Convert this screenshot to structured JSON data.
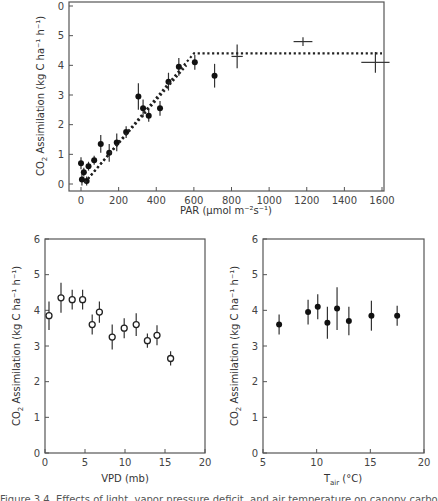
{
  "chart_data": [
    {
      "type": "scatter",
      "id": "par",
      "title": "",
      "xlabel": "PAR (µmol m⁻²s⁻¹)",
      "ylabel": "CO₂ Assimilation (kg C ha⁻¹ h⁻¹)",
      "xlim": [
        0,
        1600
      ],
      "ylim": [
        0,
        6
      ],
      "xticks": [
        0,
        200,
        400,
        600,
        800,
        1000,
        1200,
        1400,
        1600
      ],
      "yticks": [
        0,
        1,
        2,
        3,
        4,
        5,
        6
      ],
      "ytick_labels": [
        "0",
        "1",
        "2",
        "3",
        "4",
        "5",
        "0"
      ],
      "grid": false,
      "series": [
        {
          "name": "observations (filled)",
          "marker": "filled-circle",
          "points": [
            {
              "x": 0,
              "y": 0.7,
              "err": 0.2
            },
            {
              "x": 5,
              "y": 0.15,
              "err": 0.2
            },
            {
              "x": 15,
              "y": 0.4,
              "err": 0.15
            },
            {
              "x": 30,
              "y": 0.1,
              "err": 0.15
            },
            {
              "x": 40,
              "y": 0.6,
              "err": 0.15
            },
            {
              "x": 70,
              "y": 0.8,
              "err": 0.15
            },
            {
              "x": 105,
              "y": 1.35,
              "err": 0.3
            },
            {
              "x": 150,
              "y": 1.05,
              "err": 0.3
            },
            {
              "x": 190,
              "y": 1.4,
              "err": 0.3
            },
            {
              "x": 240,
              "y": 1.75,
              "err": 0.2
            },
            {
              "x": 305,
              "y": 2.95,
              "err": 0.45
            },
            {
              "x": 330,
              "y": 2.55,
              "err": 0.3
            },
            {
              "x": 360,
              "y": 2.3,
              "err": 0.2
            },
            {
              "x": 420,
              "y": 2.55,
              "err": 0.25
            },
            {
              "x": 465,
              "y": 3.45,
              "err": 0.3
            },
            {
              "x": 520,
              "y": 3.95,
              "err": 0.3
            },
            {
              "x": 605,
              "y": 4.1,
              "err": 0.25
            },
            {
              "x": 710,
              "y": 3.65,
              "err": 0.4
            }
          ]
        },
        {
          "name": "observations (cross)",
          "marker": "cross",
          "points": [
            {
              "x": 830,
              "y": 4.3,
              "err": 0.4,
              "xerr": 30
            },
            {
              "x": 1180,
              "y": 4.8,
              "err": 0.15,
              "xerr": 50
            },
            {
              "x": 1565,
              "y": 4.1,
              "err": 0.35,
              "xerr": 75
            }
          ]
        },
        {
          "name": "fitted model",
          "style": "dotted-line",
          "points": [
            {
              "x": 20,
              "y": 0.05
            },
            {
              "x": 600,
              "y": 4.4
            },
            {
              "x": 1600,
              "y": 4.4
            }
          ]
        },
        {
          "name": "fitted model (lower segment)",
          "style": "dotted-line",
          "points": [
            {
              "x": 20,
              "y": 0.05
            },
            {
              "x": 560,
              "y": 4.0
            }
          ]
        }
      ]
    },
    {
      "type": "scatter",
      "id": "vpd",
      "xlabel": "VPD (mb)",
      "ylabel": "CO₂ Assimilation (kg C ha⁻¹ h⁻¹)",
      "xlim": [
        0,
        20
      ],
      "ylim": [
        0,
        6
      ],
      "xticks": [
        0,
        5,
        10,
        15,
        20
      ],
      "yticks": [
        0,
        1,
        2,
        3,
        4,
        5,
        6
      ],
      "grid": false,
      "series": [
        {
          "name": "observations",
          "marker": "open-circle",
          "points": [
            {
              "x": 0.5,
              "y": 3.85,
              "err": 0.4
            },
            {
              "x": 2.0,
              "y": 4.35,
              "err": 0.42
            },
            {
              "x": 3.4,
              "y": 4.3,
              "err": 0.28
            },
            {
              "x": 4.7,
              "y": 4.3,
              "err": 0.28
            },
            {
              "x": 5.9,
              "y": 3.6,
              "err": 0.28
            },
            {
              "x": 6.8,
              "y": 3.95,
              "err": 0.3
            },
            {
              "x": 8.4,
              "y": 3.25,
              "err": 0.35
            },
            {
              "x": 9.9,
              "y": 3.5,
              "err": 0.28
            },
            {
              "x": 11.4,
              "y": 3.6,
              "err": 0.32
            },
            {
              "x": 12.8,
              "y": 3.15,
              "err": 0.2
            },
            {
              "x": 14.0,
              "y": 3.3,
              "err": 0.28
            },
            {
              "x": 15.7,
              "y": 2.65,
              "err": 0.2
            }
          ]
        }
      ]
    },
    {
      "type": "scatter",
      "id": "tair",
      "xlabel": "T_air (°C)",
      "ylabel": "CO₂ Assimilation (kg C ha⁻¹ h⁻¹)",
      "xlim": [
        5,
        20
      ],
      "ylim": [
        0,
        6
      ],
      "xticks": [
        5,
        10,
        15,
        20
      ],
      "yticks": [
        0,
        1,
        2,
        3,
        4,
        5,
        6
      ],
      "grid": false,
      "series": [
        {
          "name": "observations",
          "marker": "filled-circle",
          "points": [
            {
              "x": 6.5,
              "y": 3.6,
              "err": 0.28
            },
            {
              "x": 9.2,
              "y": 3.95,
              "err": 0.35
            },
            {
              "x": 10.1,
              "y": 4.1,
              "err": 0.35
            },
            {
              "x": 11.0,
              "y": 3.65,
              "err": 0.45
            },
            {
              "x": 11.9,
              "y": 4.05,
              "err": 0.6
            },
            {
              "x": 13.0,
              "y": 3.7,
              "err": 0.4
            },
            {
              "x": 15.1,
              "y": 3.85,
              "err": 0.42
            },
            {
              "x": 17.5,
              "y": 3.85,
              "err": 0.28
            }
          ]
        }
      ]
    }
  ],
  "labels": {
    "par_x": "PAR (µmol m⁻²s⁻¹)",
    "y_prefix": "CO",
    "y_sub": "2",
    "y_suffix": " Assimilation (kg C ha⁻¹ h⁻¹)",
    "vpd_x": "VPD (mb)",
    "tair_x_main": "T",
    "tair_x_sub": "air",
    "tair_x_unit": " (°C)"
  },
  "caption": "Figure 3.4. Effects of light, vapor pressure deficit, and air temperature on canopy carbon assimilation"
}
